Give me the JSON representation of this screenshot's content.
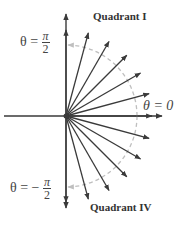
{
  "diagram": {
    "origin": [
      66,
      116
    ],
    "arc_radius": 71,
    "arrow_length": 86,
    "angles_deg": [
      90,
      75,
      60,
      45,
      30,
      15,
      0,
      -15,
      -30,
      -45,
      -60,
      -75,
      -90
    ],
    "colors": {
      "arrow": "#3a3a3a",
      "dashed_arc": "#bfbfbf",
      "text": "#333333"
    }
  },
  "labels": {
    "quadrant_top": "Quadrant I",
    "quadrant_bottom": "Quadrant IV",
    "theta_top": {
      "lhs": "θ =",
      "num": "π",
      "den": "2"
    },
    "theta_right": "θ = 0",
    "theta_bottom": {
      "lhs": "θ = −",
      "num": "π",
      "den": "2"
    }
  }
}
